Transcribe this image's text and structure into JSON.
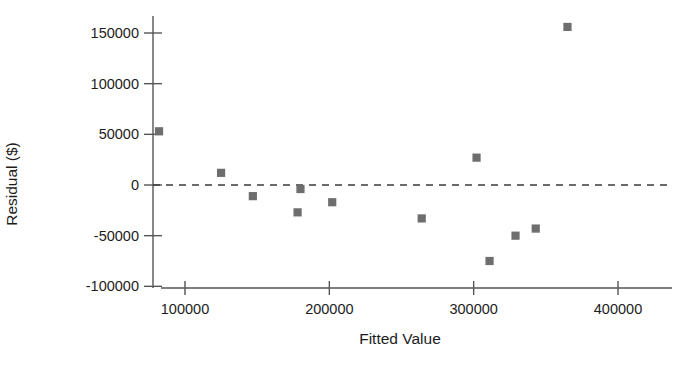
{
  "chart_data": {
    "type": "scatter",
    "title": "",
    "xlabel": "Fitted Value",
    "ylabel": "Residual ($)",
    "xlim": [
      64000,
      425000
    ],
    "ylim": [
      -118000,
      172000
    ],
    "grid": false,
    "legend": null,
    "zero_reference_line": 0,
    "marker_style": "filled-square",
    "marker_color": "#6e6e6e",
    "xticks": [
      100000,
      200000,
      300000,
      400000
    ],
    "xtick_labels": [
      "100000",
      "200000",
      "300000",
      "400000"
    ],
    "yticks": [
      -100000,
      -50000,
      0,
      50000,
      100000,
      150000
    ],
    "ytick_labels": [
      "-100000",
      "-50000",
      "0",
      "50000",
      "100000",
      "150000"
    ],
    "points": [
      {
        "x": 82000,
        "y": 53000
      },
      {
        "x": 125000,
        "y": 12000
      },
      {
        "x": 147000,
        "y": -11000
      },
      {
        "x": 178000,
        "y": -27000
      },
      {
        "x": 180000,
        "y": -4000
      },
      {
        "x": 202000,
        "y": -17000
      },
      {
        "x": 264000,
        "y": -33000
      },
      {
        "x": 302000,
        "y": 27000
      },
      {
        "x": 311000,
        "y": -75000
      },
      {
        "x": 329000,
        "y": -50000
      },
      {
        "x": 343000,
        "y": -43000
      },
      {
        "x": 365000,
        "y": 156000
      }
    ]
  },
  "axes": {
    "x_title": "Fitted Value",
    "y_title": "Residual ($)"
  }
}
